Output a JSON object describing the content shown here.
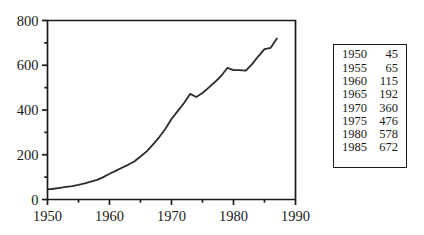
{
  "chart_data": {
    "type": "line",
    "title": "",
    "subtitle": "",
    "xlabel": "",
    "ylabel": "",
    "xlim": [
      1950,
      1990
    ],
    "ylim": [
      0,
      800
    ],
    "grid": false,
    "legend": null,
    "x_ticks": [
      1950,
      1960,
      1970,
      1980,
      1990
    ],
    "x_tick_labels": [
      "1950",
      "1960",
      "1970",
      "1980",
      "1990"
    ],
    "x_minor_ticks": [
      1955,
      1965,
      1975,
      1985
    ],
    "y_ticks": [
      0,
      200,
      400,
      600,
      800
    ],
    "y_tick_labels": [
      "0",
      "200",
      "400",
      "600",
      "800"
    ],
    "y_minor_ticks": [
      100,
      300,
      500,
      700
    ],
    "line_color": "#2b2b2b",
    "line_width": 1.8,
    "series": [
      {
        "name": "series-1",
        "x": [
          1950,
          1951,
          1952,
          1953,
          1954,
          1955,
          1956,
          1957,
          1958,
          1959,
          1960,
          1961,
          1962,
          1963,
          1964,
          1965,
          1966,
          1967,
          1968,
          1969,
          1970,
          1971,
          1972,
          1973,
          1974,
          1975,
          1976,
          1977,
          1978,
          1979,
          1980,
          1981,
          1982,
          1983,
          1984,
          1985,
          1986,
          1987
        ],
        "values": [
          45,
          48,
          52,
          56,
          60,
          65,
          72,
          80,
          88,
          100,
          115,
          128,
          142,
          155,
          170,
          192,
          215,
          245,
          278,
          315,
          360,
          395,
          430,
          472,
          458,
          476,
          500,
          525,
          552,
          588,
          578,
          578,
          576,
          605,
          640,
          672,
          678,
          720
        ]
      }
    ]
  },
  "data_table": {
    "columns": [
      "year",
      "value"
    ],
    "rows": [
      {
        "year": "1950",
        "value": "45"
      },
      {
        "year": "1955",
        "value": "65"
      },
      {
        "year": "1960",
        "value": "115"
      },
      {
        "year": "1965",
        "value": "192"
      },
      {
        "year": "1970",
        "value": "360"
      },
      {
        "year": "1975",
        "value": "476"
      },
      {
        "year": "1980",
        "value": "578"
      },
      {
        "year": "1985",
        "value": "672"
      }
    ]
  }
}
